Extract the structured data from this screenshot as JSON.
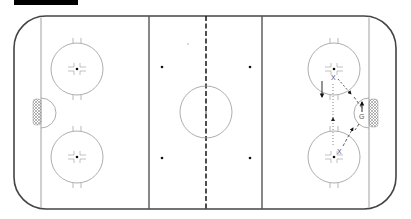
{
  "diagram": {
    "type": "hockey-rink-drill",
    "title_bar": "",
    "colors": {
      "boards": "#444444",
      "lines": "#777777",
      "blue_line": "#555555",
      "red_line": "#222222",
      "circles": "#888888",
      "goal_net": "#999999",
      "play": "#222222"
    },
    "players": [
      {
        "label": "X",
        "role": "skater-top",
        "x": 334,
        "y": 77
      },
      {
        "label": "X",
        "role": "skater-bottom",
        "x": 340,
        "y": 151
      },
      {
        "label": "G",
        "role": "goalie",
        "x": 362,
        "y": 113
      }
    ],
    "annotations": {
      "skater_top_label": "X",
      "skater_bottom_label": "X",
      "goalie_label": "G"
    }
  }
}
